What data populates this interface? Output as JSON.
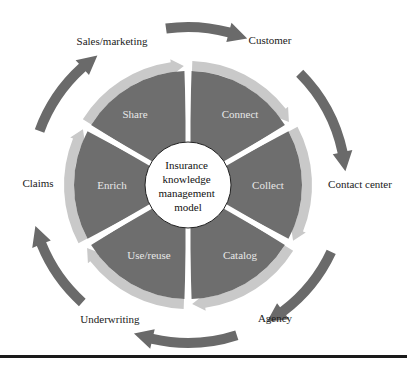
{
  "center_label": [
    "Insurance",
    "knowledge",
    "management",
    "model"
  ],
  "segments": [
    {
      "label": "Share"
    },
    {
      "label": "Connect"
    },
    {
      "label": "Collect"
    },
    {
      "label": "Catalog"
    },
    {
      "label": "Use/reuse"
    },
    {
      "label": "Enrich"
    }
  ],
  "outer_labels": [
    {
      "label": "Sales/marketing"
    },
    {
      "label": "Customer"
    },
    {
      "label": "Contact center"
    },
    {
      "label": "Agency"
    },
    {
      "label": "Underwriting"
    },
    {
      "label": "Claims"
    }
  ],
  "colors": {
    "segment": "#6e6e6e",
    "inner_arrow": "#c9c9c9",
    "outer_arrow": "#6a6a6a",
    "center": "#ffffff"
  }
}
